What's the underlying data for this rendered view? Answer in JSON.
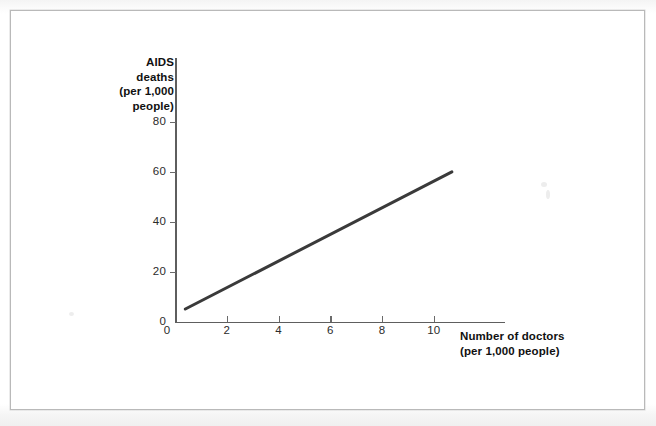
{
  "figure": {
    "background_color": "#ffffff",
    "frame_color": "#b9b9b9",
    "line_color": "#3a3a3a",
    "axis_color": "#5e5e5e"
  },
  "chart_data": {
    "type": "line",
    "title": "",
    "xlabel_line1": "Number of doctors",
    "xlabel_line2": "(per 1,000 people)",
    "ylabel_line1": "AIDS",
    "ylabel_line2": "deaths",
    "ylabel_line3": "(per 1,000",
    "ylabel_line4": "people)",
    "xlim": [
      0,
      12.75
    ],
    "ylim": [
      0,
      92
    ],
    "xticks": [
      2,
      4,
      6,
      8,
      10
    ],
    "xtick_labels": [
      "2",
      "4",
      "6",
      "8",
      "10"
    ],
    "yticks": [
      0,
      20,
      40,
      60,
      80
    ],
    "ytick_labels": [
      "0",
      "20",
      "40",
      "60",
      "80"
    ],
    "grid": false,
    "legend": null,
    "series": [
      {
        "name": "AIDS deaths vs doctors",
        "style": "solid",
        "color": "#3a3a3a",
        "width_px": 3,
        "x": [
          0.4,
          10.7
        ],
        "y": [
          5,
          60
        ]
      }
    ],
    "annotations": []
  }
}
